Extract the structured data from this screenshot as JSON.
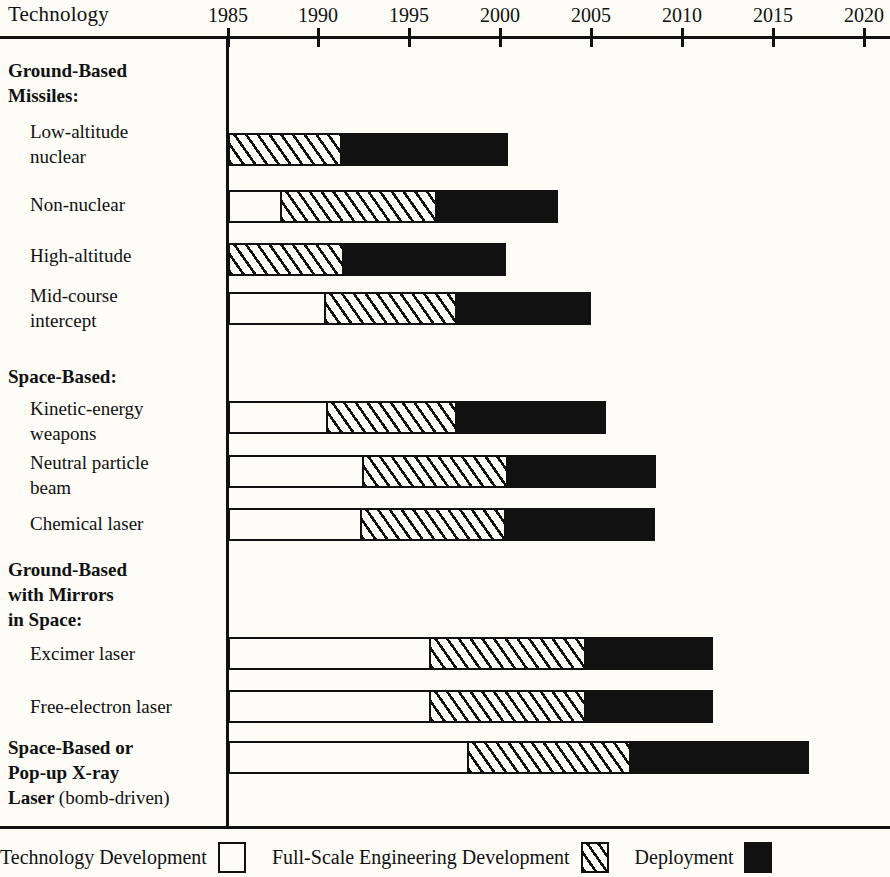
{
  "header": {
    "row_axis_title": "Technology"
  },
  "axis": {
    "year_labels": [
      "1985",
      "1990",
      "1995",
      "2000",
      "2005",
      "2010",
      "2015",
      "2020"
    ],
    "year_values": [
      1985,
      1990,
      1995,
      2000,
      2005,
      2010,
      2015,
      2020
    ],
    "tick_x": [
      228,
      318,
      409,
      500,
      591,
      682,
      773,
      864
    ]
  },
  "legend": {
    "items": [
      {
        "label": "Technology Development",
        "swatch": "tech",
        "color": "#ffffff"
      },
      {
        "label": "Full-Scale Engineering Development",
        "swatch": "fsed",
        "color": "#hatched"
      },
      {
        "label": "Deployment",
        "swatch": "deploy",
        "color": "#111111"
      }
    ]
  },
  "groups": [
    {
      "title": "Ground-Based\nMissiles:",
      "rows": [
        {
          "label": "Low-altitude\nnuclear"
        },
        {
          "label": "Non-nuclear"
        },
        {
          "label": "High-altitude"
        },
        {
          "label": "Mid-course\nintercept"
        }
      ]
    },
    {
      "title": "Space-Based:",
      "rows": [
        {
          "label": "Kinetic-energy\nweapons"
        },
        {
          "label": "Neutral particle\nbeam"
        },
        {
          "label": "Chemical laser"
        }
      ]
    },
    {
      "title": "Ground-Based\nwith Mirrors\nin Space:",
      "rows": [
        {
          "label": "Excimer laser"
        },
        {
          "label": "Free-electron laser"
        }
      ]
    },
    {
      "title": "Space-Based or\nPop-up X-ray\nLaser (bomb-driven)",
      "title_suffix_regular": "(bomb-driven)",
      "rows": []
    }
  ],
  "chart_data": {
    "type": "bar",
    "chart_style": "gantt-timeline",
    "title": "Technology",
    "xlabel": "",
    "ylabel": "Technology",
    "xlim": [
      1985,
      2022
    ],
    "grid": false,
    "legend_position": "bottom",
    "x_tick_labels": [
      "1985",
      "1990",
      "1995",
      "2000",
      "2005",
      "2010",
      "2015",
      "2020"
    ],
    "phases": [
      "Technology Development",
      "Full-Scale Engineering Development",
      "Deployment"
    ],
    "categories": [
      "Low-altitude nuclear",
      "Non-nuclear",
      "High-altitude",
      "Mid-course intercept",
      "Kinetic-energy weapons",
      "Neutral particle beam",
      "Chemical laser",
      "Excimer laser",
      "Free-electron laser",
      "Space-Based or Pop-up X-ray Laser (bomb-driven)"
    ],
    "bars": [
      {
        "category": "Low-altitude nuclear",
        "group": "Ground-Based Missiles:",
        "segments": [
          {
            "phase": "Full-Scale Engineering Development",
            "start": 1985.0,
            "end": 1991.3
          },
          {
            "phase": "Deployment",
            "start": 1991.3,
            "end": 2000.4
          }
        ]
      },
      {
        "category": "Non-nuclear",
        "group": "Ground-Based Missiles:",
        "segments": [
          {
            "phase": "Technology Development",
            "start": 1985.0,
            "end": 1988.0
          },
          {
            "phase": "Full-Scale Engineering Development",
            "start": 1988.0,
            "end": 1996.5
          },
          {
            "phase": "Deployment",
            "start": 1996.5,
            "end": 2003.2
          }
        ]
      },
      {
        "category": "High-altitude",
        "group": "Ground-Based Missiles:",
        "segments": [
          {
            "phase": "Full-Scale Engineering Development",
            "start": 1985.0,
            "end": 1991.4
          },
          {
            "phase": "Deployment",
            "start": 1991.4,
            "end": 2000.3
          }
        ]
      },
      {
        "category": "Mid-course intercept",
        "group": "Ground-Based Missiles:",
        "segments": [
          {
            "phase": "Technology Development",
            "start": 1985.0,
            "end": 1990.4
          },
          {
            "phase": "Full-Scale Engineering Development",
            "start": 1990.4,
            "end": 1997.6
          },
          {
            "phase": "Deployment",
            "start": 1997.6,
            "end": 2005.0
          }
        ]
      },
      {
        "category": "Kinetic-energy weapons",
        "group": "Space-Based:",
        "segments": [
          {
            "phase": "Technology Development",
            "start": 1985.0,
            "end": 1990.5
          },
          {
            "phase": "Full-Scale Engineering Development",
            "start": 1990.5,
            "end": 1997.6
          },
          {
            "phase": "Deployment",
            "start": 1997.6,
            "end": 2005.8
          }
        ]
      },
      {
        "category": "Neutral particle beam",
        "group": "Space-Based:",
        "segments": [
          {
            "phase": "Technology Development",
            "start": 1985.0,
            "end": 1992.5
          },
          {
            "phase": "Full-Scale Engineering Development",
            "start": 1992.5,
            "end": 2000.4
          },
          {
            "phase": "Deployment",
            "start": 2000.4,
            "end": 2008.6
          }
        ]
      },
      {
        "category": "Chemical laser",
        "group": "Space-Based:",
        "segments": [
          {
            "phase": "Technology Development",
            "start": 1985.0,
            "end": 1992.4
          },
          {
            "phase": "Full-Scale Engineering Development",
            "start": 1992.4,
            "end": 2000.3
          },
          {
            "phase": "Deployment",
            "start": 2000.3,
            "end": 2008.5
          }
        ]
      },
      {
        "category": "Excimer laser",
        "group": "Ground-Based with Mirrors in Space:",
        "segments": [
          {
            "phase": "Technology Development",
            "start": 1985.0,
            "end": 1996.2
          },
          {
            "phase": "Full-Scale Engineering Development",
            "start": 1996.2,
            "end": 2004.7
          },
          {
            "phase": "Deployment",
            "start": 2004.7,
            "end": 2011.7
          }
        ]
      },
      {
        "category": "Free-electron laser",
        "group": "Ground-Based with Mirrors in Space:",
        "segments": [
          {
            "phase": "Technology Development",
            "start": 1985.0,
            "end": 1996.2
          },
          {
            "phase": "Full-Scale Engineering Development",
            "start": 1996.2,
            "end": 2004.7
          },
          {
            "phase": "Deployment",
            "start": 2004.7,
            "end": 2011.7
          }
        ]
      },
      {
        "category": "Space-Based or Pop-up X-ray Laser (bomb-driven)",
        "group": "Space-Based or Pop-up X-ray Laser (bomb-driven)",
        "segments": [
          {
            "phase": "Technology Development",
            "start": 1985.0,
            "end": 1998.3
          },
          {
            "phase": "Full-Scale Engineering Development",
            "start": 1998.3,
            "end": 2007.2
          },
          {
            "phase": "Deployment",
            "start": 2007.2,
            "end": 2017.0
          }
        ]
      }
    ]
  },
  "layout": {
    "x_origin_px": 228,
    "px_per_year": 18.15,
    "bar_height_px": 33,
    "rows_px": [
      {
        "key": "Low-altitude nuclear",
        "top": 133,
        "label_top": 119
      },
      {
        "key": "Non-nuclear",
        "top": 190,
        "label_top": 192
      },
      {
        "key": "High-altitude",
        "top": 243,
        "label_top": 243
      },
      {
        "key": "Mid-course intercept",
        "top": 292,
        "label_top": 283
      },
      {
        "key": "Kinetic-energy weapons",
        "top": 401,
        "label_top": 396
      },
      {
        "key": "Neutral particle beam",
        "top": 455,
        "label_top": 450
      },
      {
        "key": "Chemical laser",
        "top": 508,
        "label_top": 511
      },
      {
        "key": "Excimer laser",
        "top": 637,
        "label_top": 641
      },
      {
        "key": "Free-electron laser",
        "top": 690,
        "label_top": 694
      },
      {
        "key": "X-ray laser",
        "top": 741,
        "label_top": 735
      }
    ],
    "group_label_px": [
      {
        "key": "Ground-Based Missiles:",
        "top": 58
      },
      {
        "key": "Space-Based:",
        "top": 364
      },
      {
        "key": "Ground-Based with Mirrors in Space:",
        "top": 557
      }
    ]
  }
}
